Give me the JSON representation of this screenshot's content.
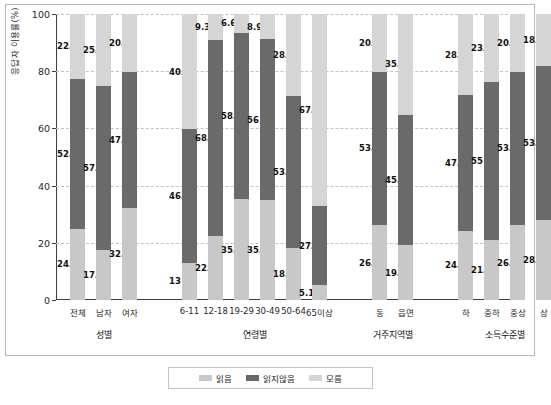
{
  "chart_data": {
    "type": "bar",
    "subtype": "stacked-bar-100",
    "title": "",
    "xlabel": "",
    "ylabel": "응답자 이용률(%)",
    "ylim": [
      0,
      100
    ],
    "yticks": [
      0,
      20,
      40,
      60,
      80,
      100
    ],
    "grid": true,
    "legend_position": "bottom",
    "legend": [
      "읽음",
      "읽지않음",
      "모름"
    ],
    "colors": {
      "read": "#c8c8c8",
      "not_read": "#6a6a6a",
      "unknown": "#d5d5d5"
    },
    "groups": [
      {
        "name": "성별",
        "categories": [
          "전체",
          "남자",
          "여자"
        ]
      },
      {
        "name": "연령별",
        "categories": [
          "6-11",
          "12-18",
          "19-29",
          "30-49",
          "50-64",
          "65이상"
        ]
      },
      {
        "name": "거주지역별",
        "categories": [
          "동",
          "읍면"
        ]
      },
      {
        "name": "소득수준별",
        "categories": [
          "하",
          "중하",
          "중상",
          "상"
        ]
      }
    ],
    "categories": [
      "전체",
      "남자",
      "여자",
      "6-11",
      "12-18",
      "19-29",
      "30-49",
      "50-64",
      "65이상",
      "동",
      "읍면",
      "하",
      "중하",
      "중상",
      "상"
    ],
    "series": [
      {
        "name": "읽음",
        "values": [
          24.9,
          17.4,
          32.3,
          13,
          22.3,
          35.2,
          35.1,
          18.1,
          5.1,
          26.1,
          19.1,
          24.3,
          21.1,
          26.1,
          28.1
        ],
        "labels": [
          "24.9",
          "17.4",
          "32.3",
          "13",
          "22.3",
          "35.2",
          "35.1",
          "18.1",
          "5.1",
          "26.1",
          "19.1",
          "24.3",
          "21.1",
          "26.1",
          "28.1"
        ]
      },
      {
        "name": "읽지않음",
        "values": [
          52.4,
          57.4,
          47.4,
          46.7,
          68.5,
          58.2,
          56,
          53.3,
          27.7,
          53.8,
          45.6,
          47.3,
          55,
          53.8,
          53.8
        ],
        "labels": [
          "52.4",
          "57.4",
          "47.4",
          "46.7",
          "68.5",
          "58.2",
          "56",
          "53.3",
          "27.7",
          "53.8",
          "45.6",
          "47.3",
          "55",
          "53.8",
          "53.8"
        ]
      },
      {
        "name": "모름",
        "values": [
          22.7,
          25.2,
          20.2,
          40.3,
          9.3,
          6.6,
          8.9,
          28.6,
          67.2,
          20.2,
          35.3,
          28.3,
          23.9,
          20.1,
          18.1
        ],
        "labels": [
          "22.7",
          "25.2",
          "20.2",
          "40.3",
          "9.3",
          "6.6",
          "8.9",
          "28.6",
          "67.2",
          "20.2",
          "35.3",
          "28.3",
          "23.9",
          "20.1",
          "18.1"
        ]
      }
    ]
  }
}
